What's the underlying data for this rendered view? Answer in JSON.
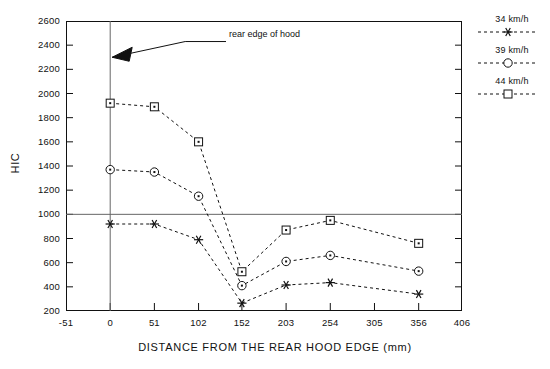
{
  "chart_data": {
    "type": "line",
    "title": "",
    "xlabel": "DISTANCE FROM THE REAR HOOD EDGE (mm)",
    "ylabel": "HIC",
    "xlim": [
      -51,
      406
    ],
    "ylim": [
      200,
      2600
    ],
    "xticks": [
      -51,
      0,
      51,
      102,
      152,
      203,
      254,
      305,
      356,
      406
    ],
    "yticks": [
      200,
      400,
      600,
      800,
      1000,
      1200,
      1400,
      1600,
      1800,
      2000,
      2200,
      2400,
      2600
    ],
    "grid": false,
    "legend_position": "right",
    "reference_lines": [
      {
        "name": "hic-threshold-line",
        "orientation": "horizontal",
        "value": 1000
      },
      {
        "name": "rear-hood-edge-line",
        "orientation": "vertical",
        "value": 0
      }
    ],
    "annotations": [
      {
        "name": "rear-edge-of-hood-annotation",
        "text": "rear edge of hood",
        "points_to_x": 0,
        "points_to_y": 2300
      }
    ],
    "x": [
      0,
      51,
      102,
      152,
      203,
      254,
      356
    ],
    "series": [
      {
        "name": "34 km/h",
        "marker": "star",
        "linestyle": "dashed",
        "values": [
          920,
          920,
          790,
          265,
          415,
          435,
          340
        ]
      },
      {
        "name": "39 km/h",
        "marker": "circle",
        "linestyle": "dashed",
        "values": [
          1370,
          1350,
          1150,
          410,
          610,
          660,
          530
        ]
      },
      {
        "name": "44 km/h",
        "marker": "square",
        "linestyle": "dashed",
        "values": [
          1920,
          1890,
          1600,
          525,
          870,
          950,
          760
        ]
      }
    ]
  },
  "axis": {
    "y_tick_labels": [
      "2600",
      "2400",
      "2200",
      "2000",
      "1800",
      "1600",
      "1400",
      "1200",
      "1000",
      "800",
      "600",
      "400",
      "200"
    ],
    "x_tick_labels": [
      "-51",
      "0",
      "51",
      "102",
      "152",
      "203",
      "254",
      "305",
      "356",
      "406"
    ],
    "x_title": "DISTANCE FROM THE REAR HOOD EDGE (mm)",
    "y_title": "HIC"
  },
  "legend": {
    "entries": [
      {
        "label": "34 km/h",
        "marker": "star-marker"
      },
      {
        "label": "39 km/h",
        "marker": "circle-marker"
      },
      {
        "label": "44 km/h",
        "marker": "square-marker"
      }
    ]
  },
  "annotation": {
    "label": "rear edge of hood"
  },
  "colors": {
    "line": "#111111",
    "frame": "#111111",
    "reference": "#555555"
  }
}
